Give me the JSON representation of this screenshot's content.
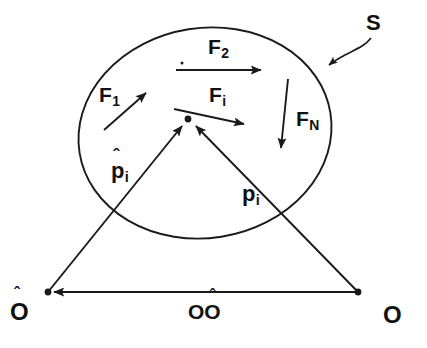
{
  "figure": {
    "type": "mechanics-free-body-diagram",
    "stroke_color": "#1a1a1a",
    "background_color": "#ffffff"
  },
  "region": {
    "name": "surface-boundary",
    "label": "S",
    "label_x": 366,
    "label_y": 12,
    "leader_arrow_tip_x": 327,
    "leader_arrow_tip_y": 66,
    "ellipse": {
      "cx": 205,
      "cy": 133,
      "rx": 127,
      "ry": 105,
      "rotation_deg": -9
    }
  },
  "particle": {
    "name": "particle-i",
    "x": 188,
    "y": 119,
    "radius": 3.4
  },
  "forces": [
    {
      "id": "F1",
      "label_base": "F",
      "label_sub": "1",
      "label_x": 99,
      "label_y": 84,
      "tail_x": 104,
      "tail_y": 130,
      "tip_x": 146,
      "tip_y": 93,
      "direction": "up-right"
    },
    {
      "id": "F2",
      "label_base": "F",
      "label_sub": "2",
      "label_x": 208,
      "label_y": 36,
      "tail_x": 176,
      "tail_y": 70,
      "tip_x": 261,
      "tip_y": 70,
      "direction": "right",
      "has_tail_dot": true,
      "tail_dot_x": 182,
      "tail_dot_y": 63
    },
    {
      "id": "Fi",
      "label_base": "F",
      "label_sub": "i",
      "label_x": 209,
      "label_y": 84,
      "tail_x": 174,
      "tail_y": 109,
      "tip_x": 244,
      "tip_y": 124,
      "direction": "down-right"
    },
    {
      "id": "FN",
      "label_base": "F",
      "label_sub": "N",
      "label_x": 296,
      "label_y": 108,
      "tail_x": 288,
      "tail_y": 79,
      "tip_x": 281,
      "tip_y": 148,
      "direction": "down"
    }
  ],
  "vectors": [
    {
      "id": "p_hat_i",
      "label_base": "p",
      "label_sub": "i",
      "has_hat": true,
      "label_x": 111,
      "label_y": 160,
      "hat_x": 113,
      "hat_y": 146,
      "tail_x": 48,
      "tail_y": 292,
      "tip_x": 182,
      "tip_y": 126,
      "from": "O-hat",
      "to": "particle-i"
    },
    {
      "id": "p_i",
      "label_base": "p",
      "label_sub": "i",
      "has_hat": false,
      "label_x": 242,
      "label_y": 183,
      "tail_x": 358,
      "tail_y": 292,
      "tip_x": 196,
      "tip_y": 126,
      "from": "O",
      "to": "particle-i"
    },
    {
      "id": "OO_hat",
      "label_base": "O",
      "label_sub": "",
      "has_hat": false,
      "label_x": 188,
      "label_y": 301,
      "tail_x": 358,
      "tail_y": 292,
      "tip_x": 54,
      "tip_y": 292,
      "from": "O",
      "to": "O-hat"
    }
  ],
  "baseline_label": {
    "name": "baseline-vector-label",
    "first": "O",
    "second": "O",
    "second_has_hat": true,
    "full_text": "OÔ"
  },
  "origins": [
    {
      "id": "O-hat",
      "label": "O",
      "has_hat": true,
      "point_x": 48,
      "point_y": 292,
      "label_x": 10,
      "label_y": 300,
      "hat_x": 14,
      "hat_y": 285
    },
    {
      "id": "O",
      "label": "O",
      "has_hat": false,
      "point_x": 358,
      "point_y": 292,
      "label_x": 383,
      "label_y": 303
    }
  ]
}
